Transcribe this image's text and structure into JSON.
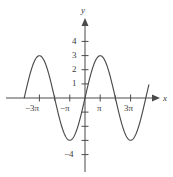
{
  "figure": {
    "background": "#ffffff",
    "curve_color": "#4a4a4a",
    "axis_color": "#4a4a4a",
    "text_color": "#3a3a3a",
    "width": 173,
    "height": 177
  },
  "axes": {
    "x_axis_label": "x",
    "y_axis_label": "y",
    "x_tick_labels": [
      {
        "text": "−3π",
        "value": -9.4248
      },
      {
        "text": "−π",
        "value": -3.1416
      },
      {
        "text": "π",
        "value": 3.1416
      },
      {
        "text": "3π",
        "value": 9.4248
      }
    ],
    "y_tick_labels": [
      {
        "text": "4",
        "value": 4
      },
      {
        "text": "3",
        "value": 3
      },
      {
        "text": "2",
        "value": 2
      },
      {
        "text": "1",
        "value": 1
      },
      {
        "text": "−4",
        "value": -4
      }
    ]
  },
  "chart_data": {
    "type": "line",
    "title": "",
    "xlabel": "x",
    "ylabel": "y",
    "function": "y = 3 sin(x/2)",
    "amplitude": 3,
    "period": "4π",
    "xlim": [
      -12.566,
      13.2
    ],
    "ylim": [
      -4.6,
      4.6
    ],
    "grid": false,
    "legend": "none",
    "xticks": [
      -9.4248,
      -6.2832,
      -3.1416,
      3.1416,
      6.2832,
      9.4248
    ],
    "xticklabels": [
      "−3π",
      "",
      "−π",
      "π",
      "",
      "3π"
    ],
    "yticks": [
      -4,
      -3,
      -2,
      -1,
      1,
      2,
      3,
      4
    ],
    "yticklabels": [
      "−4",
      "",
      "",
      "",
      "1",
      "2",
      "3",
      "4"
    ],
    "key_points": [
      {
        "x": -12.566,
        "y": 0,
        "note": "left edge zero at -4π"
      },
      {
        "x": -9.4248,
        "y": 3,
        "note": "maximum at -3π"
      },
      {
        "x": -6.2832,
        "y": 0,
        "note": "zero at -2π"
      },
      {
        "x": -3.1416,
        "y": -3,
        "note": "minimum at -π"
      },
      {
        "x": 0,
        "y": 0,
        "note": "zero at origin"
      },
      {
        "x": 3.1416,
        "y": 3,
        "note": "maximum at π"
      },
      {
        "x": 6.2832,
        "y": 0,
        "note": "zero at 2π"
      },
      {
        "x": 9.4248,
        "y": -3,
        "note": "minimum at 3π"
      },
      {
        "x": 12.566,
        "y": 0,
        "note": "zero at 4π"
      }
    ],
    "series": [
      {
        "name": "y = 3 sin(x/2)",
        "x": [
          -12.566,
          -11.781,
          -10.996,
          -10.21,
          -9.425,
          -8.639,
          -7.854,
          -7.069,
          -6.283,
          -5.498,
          -4.712,
          -3.927,
          -3.142,
          -2.356,
          -1.571,
          -0.785,
          0,
          0.785,
          1.571,
          2.356,
          3.142,
          3.927,
          4.712,
          5.498,
          6.283,
          7.069,
          7.854,
          8.639,
          9.425,
          10.21,
          10.996,
          11.781,
          12.566,
          13.2
        ],
        "values": [
          0,
          1.148,
          2.121,
          2.772,
          3,
          2.772,
          2.121,
          1.148,
          0,
          -1.148,
          -2.121,
          -2.772,
          -3,
          -2.772,
          -2.121,
          -1.148,
          0,
          1.148,
          2.121,
          2.772,
          3,
          2.772,
          2.121,
          1.148,
          0,
          -1.148,
          -2.121,
          -2.772,
          -3,
          -2.772,
          -2.121,
          -1.148,
          0,
          0.948
        ]
      }
    ]
  }
}
